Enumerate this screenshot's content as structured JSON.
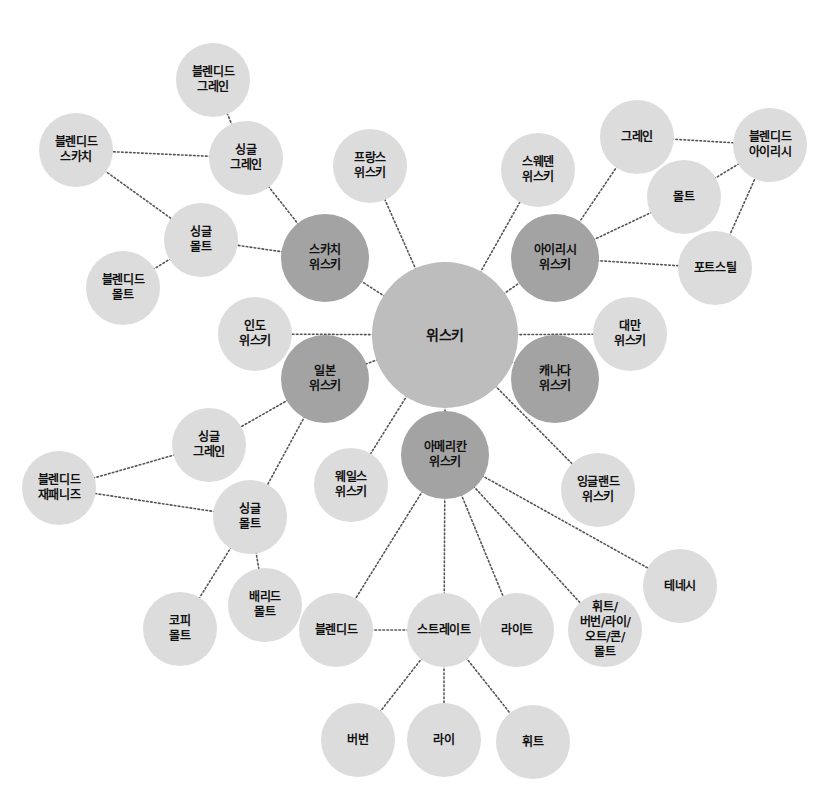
{
  "diagram": {
    "type": "mind-map",
    "colors": {
      "root": "#bdbdbd",
      "category": "#a3a3a3",
      "leaf": "#dcdcdc",
      "edge": "#555555",
      "text": "#111111"
    },
    "nodes": [
      {
        "id": "whisky",
        "label": "위스키",
        "kind": "root",
        "x": 445,
        "y": 335,
        "r": 73
      },
      {
        "id": "scotch",
        "label": "스카치\n위스키",
        "kind": "category",
        "x": 325,
        "y": 258,
        "r": 44
      },
      {
        "id": "irish",
        "label": "아이리시\n위스키",
        "kind": "category",
        "x": 555,
        "y": 258,
        "r": 44
      },
      {
        "id": "japan",
        "label": "일본\n위스키",
        "kind": "category",
        "x": 325,
        "y": 379,
        "r": 44
      },
      {
        "id": "canada",
        "label": "캐나다\n위스키",
        "kind": "category",
        "x": 555,
        "y": 379,
        "r": 44
      },
      {
        "id": "american",
        "label": "아메리칸\n위스키",
        "kind": "category",
        "x": 445,
        "y": 455,
        "r": 44
      },
      {
        "id": "france",
        "label": "프랑스\n위스키",
        "kind": "leaf",
        "x": 370,
        "y": 166,
        "r": 37
      },
      {
        "id": "sweden",
        "label": "스웨덴\n위스키",
        "kind": "leaf",
        "x": 538,
        "y": 170,
        "r": 37
      },
      {
        "id": "india",
        "label": "인도\n위스키",
        "kind": "leaf",
        "x": 255,
        "y": 334,
        "r": 37
      },
      {
        "id": "taiwan",
        "label": "대만\n위스키",
        "kind": "leaf",
        "x": 630,
        "y": 334,
        "r": 37
      },
      {
        "id": "wales",
        "label": "웨일스\n위스키",
        "kind": "leaf",
        "x": 351,
        "y": 485,
        "r": 37
      },
      {
        "id": "england",
        "label": "잉글랜드\n위스키",
        "kind": "leaf",
        "x": 598,
        "y": 490,
        "r": 37
      },
      {
        "id": "sc_blended_grain",
        "label": "블렌디드\n그레인",
        "kind": "leaf",
        "x": 213,
        "y": 80,
        "r": 37
      },
      {
        "id": "sc_single_grain",
        "label": "싱글\n그레인",
        "kind": "leaf",
        "x": 246,
        "y": 158,
        "r": 37
      },
      {
        "id": "sc_blended_scotch",
        "label": "블렌디드\n스카치",
        "kind": "leaf",
        "x": 76,
        "y": 150,
        "r": 37
      },
      {
        "id": "sc_single_malt",
        "label": "싱글\n몰트",
        "kind": "leaf",
        "x": 201,
        "y": 240,
        "r": 37
      },
      {
        "id": "sc_blended_malt",
        "label": "블렌디드\n몰트",
        "kind": "leaf",
        "x": 123,
        "y": 288,
        "r": 37
      },
      {
        "id": "ir_grain",
        "label": "그레인",
        "kind": "leaf",
        "x": 637,
        "y": 137,
        "r": 37
      },
      {
        "id": "ir_blended_irish",
        "label": "블렌디드\n아이리시",
        "kind": "leaf",
        "x": 770,
        "y": 145,
        "r": 37
      },
      {
        "id": "ir_malt",
        "label": "몰트",
        "kind": "leaf",
        "x": 684,
        "y": 197,
        "r": 37
      },
      {
        "id": "ir_pot_still",
        "label": "포트스틸",
        "kind": "leaf",
        "x": 715,
        "y": 268,
        "r": 37
      },
      {
        "id": "jp_single_grain",
        "label": "싱글\n그레인",
        "kind": "leaf",
        "x": 209,
        "y": 445,
        "r": 37
      },
      {
        "id": "jp_blended_japanese",
        "label": "블렌디드\n재패니즈",
        "kind": "leaf",
        "x": 59,
        "y": 488,
        "r": 37
      },
      {
        "id": "jp_single_malt",
        "label": "싱글\n몰트",
        "kind": "leaf",
        "x": 250,
        "y": 517,
        "r": 37
      },
      {
        "id": "jp_coffey_malt",
        "label": "코피\n몰트",
        "kind": "leaf",
        "x": 180,
        "y": 629,
        "r": 37
      },
      {
        "id": "jp_buried_malt",
        "label": "배리드\n몰트",
        "kind": "leaf",
        "x": 265,
        "y": 605,
        "r": 37
      },
      {
        "id": "am_blended",
        "label": "블렌디드",
        "kind": "leaf",
        "x": 336,
        "y": 630,
        "r": 37
      },
      {
        "id": "am_straight",
        "label": "스트레이트",
        "kind": "leaf",
        "x": 444,
        "y": 630,
        "r": 37
      },
      {
        "id": "am_light",
        "label": "라이트",
        "kind": "leaf",
        "x": 517,
        "y": 630,
        "r": 37
      },
      {
        "id": "am_wheat_etc",
        "label": "휘트/\n버번/라이/\n오트/콘/\n몰트",
        "kind": "leaf",
        "x": 605,
        "y": 630,
        "r": 37
      },
      {
        "id": "am_tennessee",
        "label": "테네시",
        "kind": "leaf",
        "x": 680,
        "y": 586,
        "r": 37
      },
      {
        "id": "am_bourbon",
        "label": "버번",
        "kind": "leaf",
        "x": 358,
        "y": 740,
        "r": 37
      },
      {
        "id": "am_rye",
        "label": "라이",
        "kind": "leaf",
        "x": 444,
        "y": 740,
        "r": 37
      },
      {
        "id": "am_wheat",
        "label": "휘트",
        "kind": "leaf",
        "x": 533,
        "y": 742,
        "r": 37
      }
    ],
    "edges": [
      [
        "whisky",
        "scotch"
      ],
      [
        "whisky",
        "irish"
      ],
      [
        "whisky",
        "japan"
      ],
      [
        "whisky",
        "canada"
      ],
      [
        "whisky",
        "american"
      ],
      [
        "whisky",
        "france"
      ],
      [
        "whisky",
        "sweden"
      ],
      [
        "whisky",
        "india"
      ],
      [
        "whisky",
        "taiwan"
      ],
      [
        "whisky",
        "wales"
      ],
      [
        "whisky",
        "england"
      ],
      [
        "scotch",
        "sc_single_grain"
      ],
      [
        "scotch",
        "sc_single_malt"
      ],
      [
        "sc_single_grain",
        "sc_blended_grain"
      ],
      [
        "sc_single_grain",
        "sc_blended_scotch"
      ],
      [
        "sc_blended_scotch",
        "sc_single_malt"
      ],
      [
        "sc_single_malt",
        "sc_blended_malt"
      ],
      [
        "irish",
        "ir_grain"
      ],
      [
        "irish",
        "ir_malt"
      ],
      [
        "irish",
        "ir_pot_still"
      ],
      [
        "ir_grain",
        "ir_blended_irish"
      ],
      [
        "ir_malt",
        "ir_blended_irish"
      ],
      [
        "ir_pot_still",
        "ir_blended_irish"
      ],
      [
        "japan",
        "jp_single_grain"
      ],
      [
        "japan",
        "jp_single_malt"
      ],
      [
        "jp_single_grain",
        "jp_blended_japanese"
      ],
      [
        "jp_single_malt",
        "jp_blended_japanese"
      ],
      [
        "jp_single_malt",
        "jp_coffey_malt"
      ],
      [
        "jp_single_malt",
        "jp_buried_malt"
      ],
      [
        "american",
        "am_blended"
      ],
      [
        "american",
        "am_straight"
      ],
      [
        "american",
        "am_light"
      ],
      [
        "american",
        "am_wheat_etc"
      ],
      [
        "american",
        "am_tennessee"
      ],
      [
        "am_blended",
        "am_straight"
      ],
      [
        "am_straight",
        "am_bourbon"
      ],
      [
        "am_straight",
        "am_rye"
      ],
      [
        "am_straight",
        "am_wheat"
      ]
    ]
  }
}
